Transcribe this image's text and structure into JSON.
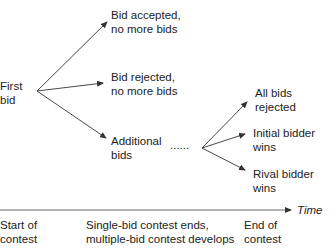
{
  "nodes": {
    "first_bid": "First\nbid",
    "bid_accepted": "Bid accepted,\nno more bids",
    "bid_rejected": "Bid rejected,\nno more bids",
    "additional_bids": "Additional\nbids",
    "ellipsis": "......",
    "all_rejected": "All bids\nrejected",
    "initial_wins": "Initial bidder\nwins",
    "rival_wins": "Rival bidder\nwins"
  },
  "timeline": {
    "axis_label": "Time",
    "markers": [
      "Start of\ncontest",
      "Single-bid contest ends,\nmultiple-bid contest develops",
      "End of\ncontest"
    ]
  },
  "colors": {
    "line": "#333333",
    "text": "#222222",
    "background": "#ffffff"
  }
}
